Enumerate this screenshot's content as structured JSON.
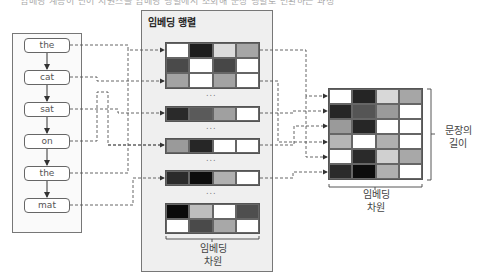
{
  "caption": "임베딩 계층이 단어 시퀀스를 임베딩 행렬에서 조회해 문장 행렬로 변환하는 과정",
  "input": {
    "words": [
      "the",
      "cat",
      "sat",
      "on",
      "the",
      "mat"
    ]
  },
  "embedding_matrix": {
    "title": "임베딩 행렬",
    "dim_label_line1": "임베딩",
    "dim_label_line2": "차원",
    "ellipsis": "...",
    "blocks": [
      {
        "rows": [
          [
            "#ffffff",
            "#1e1e1e",
            "#dcdcdc",
            "#a6a6a6"
          ],
          [
            "#4a4a4a",
            "#ffffff",
            "#474747",
            "#ffffff"
          ],
          [
            "#a3a3a3",
            "#ffffff",
            "#a3a3a3",
            "#ffffff"
          ]
        ]
      },
      {
        "rows": [
          [
            "#2a2a2a",
            "#5a5a5a",
            "#a0a0a0",
            "#ffffff"
          ]
        ]
      },
      {
        "rows": [
          [
            "#9a9a9a",
            "#262626",
            "#ffffff",
            "#ffffff"
          ]
        ]
      },
      {
        "rows": [
          [
            "#2b2b2b",
            "#0d0d0d",
            "#b0b0b0",
            "#ffffff"
          ]
        ]
      },
      {
        "rows": [
          [
            "#0a0a0a",
            "#bdbdbd",
            "#ffffff",
            "#4e4e4e"
          ],
          [
            "#ffffff",
            "#4a4a4a",
            "#a8a8a8",
            "#ffffff"
          ]
        ]
      }
    ]
  },
  "sentence_matrix": {
    "rows": [
      [
        "#ffffff",
        "#252525",
        "#d8d8d8",
        "#a6a6a6"
      ],
      [
        "#262626",
        "#555555",
        "#9a9a9a",
        "#ffffff"
      ],
      [
        "#9a9a9a",
        "#262626",
        "#ffffff",
        "#ffffff"
      ],
      [
        "#b5b5b5",
        "#ffffff",
        "#b0b0b0",
        "#ffffff"
      ],
      [
        "#ffffff",
        "#2a2a2a",
        "#d0d0d0",
        "#a8a8a8"
      ],
      [
        "#2b2b2b",
        "#0d0d0d",
        "#b0b0b0",
        "#ffffff"
      ]
    ],
    "length_label_line1": "문장의",
    "length_label_line2": "길이",
    "dim_label_line1": "임베딩",
    "dim_label_line2": "차원"
  },
  "colors": {
    "line": "#555555",
    "panel_bg": "#efefef",
    "border": "#777777"
  }
}
